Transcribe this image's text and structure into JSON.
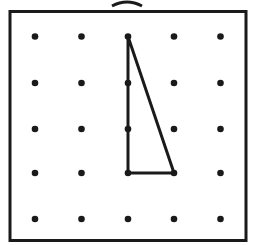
{
  "diagram": {
    "type": "geoboard",
    "grid": {
      "rows": 5,
      "cols": 5
    },
    "shape": {
      "kind": "right-triangle",
      "vertices_grid": [
        [
          2,
          0
        ],
        [
          2,
          3
        ],
        [
          3,
          3
        ]
      ]
    },
    "colors": {
      "stroke": "#1a1a1a",
      "background": "#ffffff"
    }
  }
}
